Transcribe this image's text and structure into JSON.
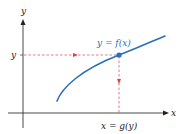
{
  "diagram": {
    "axes": {
      "x_label": "x",
      "y_label": "y"
    },
    "curve": {
      "label": "y = f(x)",
      "color": "#2a6fb8"
    },
    "point": {
      "y_tick_label": "y",
      "x_tick_label": "x = g(y)",
      "color": "#2a6fb8"
    },
    "guides": {
      "color": "#d9434a",
      "style": "dashed"
    }
  }
}
